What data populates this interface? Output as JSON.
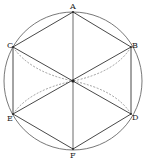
{
  "diagram": {
    "type": "geometry",
    "colors": {
      "stroke": "#333333",
      "circle": "#555555",
      "dashed": "#777777",
      "background": "#ffffff"
    },
    "circle": {
      "cx": 73,
      "cy": 81,
      "r": 69
    },
    "center_point": {
      "x": 73,
      "y": 81
    },
    "points": {
      "A": {
        "label": "A",
        "x": 73,
        "y": 12
      },
      "B": {
        "label": "B",
        "x": 131,
        "y": 47
      },
      "C": {
        "label": "C",
        "x": 13,
        "y": 47
      },
      "D": {
        "label": "D",
        "x": 131,
        "y": 114
      },
      "E": {
        "label": "E",
        "x": 13,
        "y": 114
      },
      "F": {
        "label": "F",
        "x": 73,
        "y": 149
      }
    },
    "labels": {
      "A": "A",
      "B": "B",
      "C": "C",
      "D": "D",
      "E": "E",
      "F": "F"
    },
    "solid_segments": [
      "AB",
      "AC",
      "BD",
      "CE",
      "EF",
      "DF",
      "AF",
      "CD",
      "BE"
    ],
    "dashed_curves": [
      "C-O",
      "E-O",
      "B-O",
      "D-O"
    ]
  }
}
